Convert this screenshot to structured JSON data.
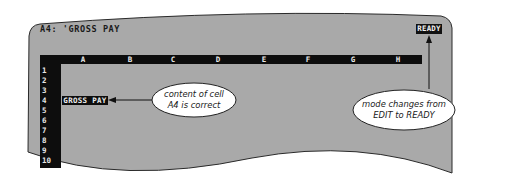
{
  "screen": {
    "status_line": "A4: 'GROSS PAY",
    "mode_indicator": "READY",
    "columns": [
      "A",
      "B",
      "C",
      "D",
      "E",
      "F",
      "G",
      "H"
    ],
    "rows": [
      "1",
      "2",
      "3",
      "4",
      "5",
      "6",
      "7",
      "8",
      "9",
      "10"
    ],
    "active_cell": {
      "address": "A4",
      "value": "GROSS PAY"
    }
  },
  "callouts": {
    "cell_content": {
      "line1": "content of cell",
      "line2": "A4 is correct"
    },
    "mode_change": {
      "line1": "mode changes from",
      "line2": "EDIT to READY"
    }
  },
  "colors": {
    "screen_fill": "#a9a9a9",
    "bar_black": "#0d0d0d",
    "text_dark": "#1a1a1a",
    "text_light": "#e8e8e8"
  }
}
